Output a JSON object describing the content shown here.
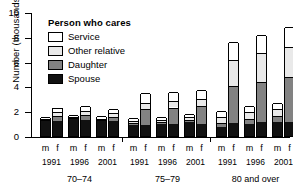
{
  "chart_data": {
    "type": "bar",
    "subtype": "stacked-grouped",
    "title": "",
    "xlabel": "",
    "ylabel": "Number (thousands)",
    "ylim": [
      0,
      10
    ],
    "yticks": [
      0,
      2,
      4,
      6,
      8,
      10
    ],
    "grid": false,
    "legend_title": "Person who cares",
    "legend_position": "inside-top-left",
    "series": [
      {
        "name": "Spouse",
        "color": "#111111",
        "order": 1
      },
      {
        "name": "Daughter",
        "color": "#828282",
        "order": 2
      },
      {
        "name": "Other relative",
        "color": "#e9e9e9",
        "order": 3
      },
      {
        "name": "Service",
        "color": "#ffffff",
        "order": 4
      }
    ],
    "age_groups": [
      "70–74",
      "75–79",
      "80 and over"
    ],
    "years": [
      "1991",
      "1996",
      "2001"
    ],
    "sexes": [
      "m",
      "f"
    ],
    "bars": [
      {
        "age": "70–74",
        "year": "1991",
        "sex": "m",
        "spouse": 1.2,
        "daughter": 0.1,
        "other": 0.1,
        "service": 0.15,
        "total": 1.55
      },
      {
        "age": "70–74",
        "year": "1991",
        "sex": "f",
        "spouse": 1.2,
        "daughter": 0.4,
        "other": 0.35,
        "service": 0.35,
        "total": 2.3
      },
      {
        "age": "70–74",
        "year": "1996",
        "sex": "m",
        "spouse": 1.35,
        "daughter": 0.1,
        "other": 0.1,
        "service": 0.15,
        "total": 1.7
      },
      {
        "age": "70–74",
        "year": "1996",
        "sex": "f",
        "spouse": 1.3,
        "daughter": 0.4,
        "other": 0.35,
        "service": 0.35,
        "total": 2.4
      },
      {
        "age": "70–74",
        "year": "2001",
        "sex": "m",
        "spouse": 1.2,
        "daughter": 0.1,
        "other": 0.1,
        "service": 0.2,
        "total": 1.6
      },
      {
        "age": "70–74",
        "year": "2001",
        "sex": "f",
        "spouse": 1.2,
        "daughter": 0.35,
        "other": 0.3,
        "service": 0.35,
        "total": 2.2
      },
      {
        "age": "75–79",
        "year": "1991",
        "sex": "m",
        "spouse": 0.9,
        "daughter": 0.15,
        "other": 0.15,
        "service": 0.25,
        "total": 1.45
      },
      {
        "age": "75–79",
        "year": "1991",
        "sex": "f",
        "spouse": 0.9,
        "daughter": 1.3,
        "other": 0.5,
        "service": 0.75,
        "total": 3.45
      },
      {
        "age": "75–79",
        "year": "1996",
        "sex": "m",
        "spouse": 1.0,
        "daughter": 0.15,
        "other": 0.15,
        "service": 0.2,
        "total": 1.5
      },
      {
        "age": "75–79",
        "year": "1996",
        "sex": "f",
        "spouse": 0.95,
        "daughter": 1.35,
        "other": 0.55,
        "service": 0.7,
        "total": 3.55
      },
      {
        "age": "75–79",
        "year": "2001",
        "sex": "m",
        "spouse": 1.1,
        "daughter": 0.2,
        "other": 0.2,
        "service": 0.25,
        "total": 1.75
      },
      {
        "age": "75–79",
        "year": "2001",
        "sex": "f",
        "spouse": 1.0,
        "daughter": 1.45,
        "other": 0.55,
        "service": 0.75,
        "total": 3.75
      },
      {
        "age": "80 and over",
        "year": "1991",
        "sex": "m",
        "spouse": 0.75,
        "daughter": 0.3,
        "other": 0.5,
        "service": 0.5,
        "total": 2.05
      },
      {
        "age": "80 and over",
        "year": "1991",
        "sex": "f",
        "spouse": 1.05,
        "daughter": 3.0,
        "other": 2.1,
        "service": 1.45,
        "total": 7.6
      },
      {
        "age": "80 and over",
        "year": "1996",
        "sex": "m",
        "spouse": 1.0,
        "daughter": 0.4,
        "other": 0.5,
        "service": 0.5,
        "total": 2.4
      },
      {
        "age": "80 and over",
        "year": "1996",
        "sex": "f",
        "spouse": 1.1,
        "daughter": 3.25,
        "other": 2.35,
        "service": 1.45,
        "total": 8.15
      },
      {
        "age": "80 and over",
        "year": "2001",
        "sex": "m",
        "spouse": 1.1,
        "daughter": 0.5,
        "other": 0.55,
        "service": 0.55,
        "total": 2.7
      },
      {
        "age": "80 and over",
        "year": "2001",
        "sex": "f",
        "spouse": 1.15,
        "daughter": 3.6,
        "other": 2.45,
        "service": 1.6,
        "total": 8.8
      }
    ]
  },
  "legend": {
    "title": "Person who cares",
    "items": [
      {
        "label": "Service"
      },
      {
        "label": "Other relative"
      },
      {
        "label": "Daughter"
      },
      {
        "label": "Spouse"
      }
    ]
  },
  "axis": {
    "y_title": "Number (thousands)",
    "y_ticks": [
      "0",
      "2",
      "4",
      "6",
      "8",
      "10"
    ]
  }
}
